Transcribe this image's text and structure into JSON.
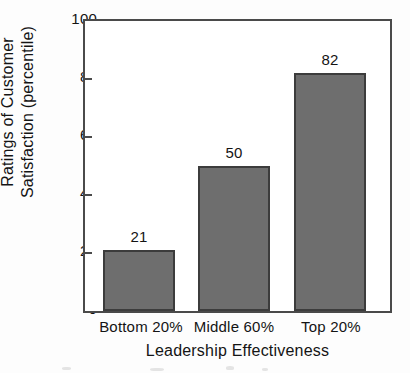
{
  "chart_data": {
    "type": "bar",
    "title": "",
    "subtitle": "",
    "xlabel": "Leadership Effectiveness",
    "ylabel": "Ratings of Customer Satisfaction (percentile)",
    "ylabel_lines": [
      "Ratings of Customer",
      "Satisfaction (percentile)"
    ],
    "categories": [
      "Bottom 20%",
      "Middle 60%",
      "Top 20%"
    ],
    "values": [
      21,
      50,
      82
    ],
    "data_labels": [
      "21",
      "50",
      "82"
    ],
    "ylim": [
      0,
      100
    ],
    "yticks": [
      0,
      20,
      40,
      60,
      80,
      100
    ],
    "ytick_labels": [
      "0",
      "20",
      "40",
      "60",
      "80",
      "100"
    ],
    "grid": false,
    "legend": null,
    "legend_position": "none",
    "bar_fill_color": "#6e6e6e",
    "bar_border_color": "#3c3c3c",
    "axis_color": "#4a4a4a",
    "background_color": "#fdfdfd",
    "text_color": "#141414"
  }
}
